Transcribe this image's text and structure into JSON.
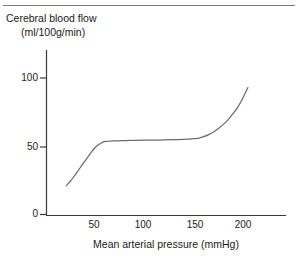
{
  "figure": {
    "name": "cerebral-blood-flow-autoregulation-figure",
    "has_top_rule": true,
    "background_color": "#ffffff",
    "line_color": "#6b6b6b",
    "axis_color": "#3a3a3a",
    "text_color": "#1a1a1a"
  },
  "title": {
    "line1": "Cerebral blood flow",
    "line2": "(ml/100g/min)"
  },
  "axes": {
    "x_title": "Mean arterial pressure (mmHg)",
    "x_ticks": [
      "50",
      "100",
      "150",
      "200"
    ],
    "y_ticks": [
      "100",
      "50",
      "0"
    ]
  },
  "chart_data": {
    "type": "line",
    "title": "Cerebral blood flow (ml/100g/min)",
    "xlabel": "Mean arterial pressure (mmHg)",
    "ylabel": "Cerebral blood flow (ml/100g/min)",
    "xlim": [
      0,
      250
    ],
    "ylim": [
      0,
      115
    ],
    "x_ticks": [
      50,
      100,
      150,
      200
    ],
    "y_ticks": [
      0,
      50,
      100
    ],
    "grid": false,
    "legend": false,
    "series": [
      {
        "name": "Cerebral blood flow",
        "x": [
          20,
          25,
          30,
          35,
          40,
          45,
          50,
          55,
          60,
          70,
          80,
          90,
          100,
          110,
          120,
          130,
          140,
          150,
          155,
          160,
          165,
          170,
          175,
          180,
          185,
          190,
          195,
          200,
          205
        ],
        "values": [
          21,
          25,
          30,
          35,
          40,
          45,
          49.5,
          52,
          53.5,
          54,
          54.2,
          54.3,
          54.4,
          54.5,
          54.6,
          54.8,
          55,
          55.5,
          56,
          57,
          58.5,
          60.5,
          63,
          66,
          69.5,
          74,
          79,
          85.5,
          93
        ]
      }
    ],
    "annotations": []
  }
}
